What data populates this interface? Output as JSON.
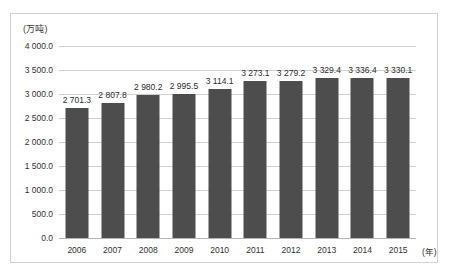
{
  "chart_data": {
    "type": "bar",
    "title": "",
    "xlabel": "(年)",
    "ylabel": "(万吨)",
    "categories": [
      "2006",
      "2007",
      "2008",
      "2009",
      "2010",
      "2011",
      "2012",
      "2013",
      "2014",
      "2015"
    ],
    "values": [
      2701.3,
      2807.8,
      2980.2,
      2995.5,
      3114.1,
      3273.1,
      3279.2,
      3329.4,
      3336.4,
      3330.1
    ],
    "value_labels": [
      "2 701.3",
      "2 807.8",
      "2 980.2",
      "2 995.5",
      "3 114.1",
      "3 273.1",
      "3 279.2",
      "3 329.4",
      "3 336.4",
      "3 330.1"
    ],
    "ylim": [
      0,
      4000
    ],
    "y_ticks": [
      0,
      500,
      1000,
      1500,
      2000,
      2500,
      3000,
      3500,
      4000
    ],
    "y_tick_labels": [
      "0.0",
      "500.0",
      "1 000.0",
      "1 500.0",
      "2 000.0",
      "2 500.0",
      "3 000.0",
      "3 500.0",
      "4 000.0"
    ],
    "grid": true,
    "legend": "none",
    "series_color": "#4d4d4d",
    "gridline_color": "#cfcfcf",
    "border_color": "#d2d2d2",
    "background_color": "#ffffff"
  }
}
